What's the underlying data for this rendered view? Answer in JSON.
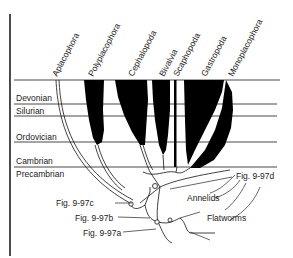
{
  "diagram": {
    "taxa": [
      {
        "name": "Aplacophora"
      },
      {
        "name": "Polyplacophora"
      },
      {
        "name": "Cephalopoda"
      },
      {
        "name": "Bivalvia"
      },
      {
        "name": "Scaphopoda"
      },
      {
        "name": "Gastropoda"
      },
      {
        "name": "Monoplacophora"
      }
    ],
    "periods": [
      {
        "name": "Devonian"
      },
      {
        "name": "Silurian"
      },
      {
        "name": "Ordovician"
      },
      {
        "name": "Cambrian"
      },
      {
        "name": "Precambrian"
      }
    ],
    "annotations": {
      "fig_d": "Fig. 9-97d",
      "fig_c": "Fig. 9-97c",
      "fig_b": "Fig. 9-97b",
      "fig_a": "Fig. 9-97a",
      "annelids": "Annelids",
      "flatworms": "Flatworms"
    }
  }
}
